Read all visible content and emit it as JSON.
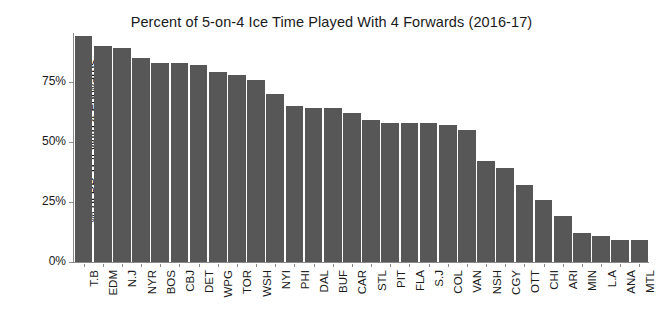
{
  "chart_data": {
    "type": "bar",
    "title": "Percent of 5-on-4 Ice Time Played With 4 Forwards (2016-17)",
    "subtitle": "",
    "xlabel": "",
    "ylabel": "% of PP TOI With 4 Forwards",
    "ylim": [
      0,
      100
    ],
    "ytick_values": [
      0,
      25,
      50,
      75
    ],
    "ytick_labels": [
      "0%",
      "25%",
      "50%",
      "75%"
    ],
    "grid": false,
    "legend": false,
    "bar_color": "#575757",
    "axis_color": "#8a8a8a",
    "categories": [
      "T.B",
      "EDM",
      "N.J",
      "NYR",
      "BOS",
      "CBJ",
      "DET",
      "WPG",
      "TOR",
      "WSH",
      "NYI",
      "PHI",
      "DAL",
      "BUF",
      "CAR",
      "STL",
      "PIT",
      "FLA",
      "S.J",
      "COL",
      "VAN",
      "NSH",
      "CGY",
      "OTT",
      "CHI",
      "ARI",
      "MIN",
      "L.A",
      "ANA",
      "MTL"
    ],
    "values": [
      94,
      90,
      89,
      85,
      83,
      83,
      82,
      79,
      78,
      76,
      70,
      65,
      64,
      64,
      62,
      59,
      58,
      58,
      58,
      57,
      55,
      42,
      39,
      32,
      26,
      19,
      12,
      11,
      9,
      9
    ]
  }
}
